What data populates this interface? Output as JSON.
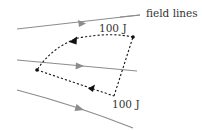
{
  "diagram": {
    "labels": {
      "field_lines": "field lines",
      "work_top": "100 J",
      "work_bottom": "100 J"
    },
    "colors": {
      "field_line": "#8c8c8c",
      "path": "#1a1a1a",
      "text": "#333333"
    },
    "field_lines": [
      {
        "id": "top",
        "from": [
          17,
          29
        ],
        "to": [
          140,
          15
        ],
        "arrow_at": [
          82,
          23
        ]
      },
      {
        "id": "middle",
        "from": [
          17,
          60
        ],
        "to": [
          137,
          71
        ],
        "arrow_at": [
          80,
          66
        ]
      },
      {
        "id": "bottom",
        "from": [
          17,
          90
        ],
        "to": [
          133,
          128
        ],
        "arrow_at": [
          80,
          108
        ]
      }
    ],
    "closed_path": {
      "vertices": [
        {
          "id": "top-right",
          "pos": [
            133,
            37
          ]
        },
        {
          "id": "left",
          "pos": [
            37,
            70
          ]
        },
        {
          "id": "bottom",
          "pos": [
            114,
            96
          ]
        }
      ],
      "segments": [
        {
          "from": "top-right",
          "to": "left",
          "shape": "arc",
          "direction": "leftward"
        },
        {
          "from": "left",
          "to": "bottom",
          "shape": "straight",
          "direction": "reversed-arrow"
        },
        {
          "from": "bottom",
          "to": "top-right",
          "shape": "straight"
        }
      ]
    }
  }
}
